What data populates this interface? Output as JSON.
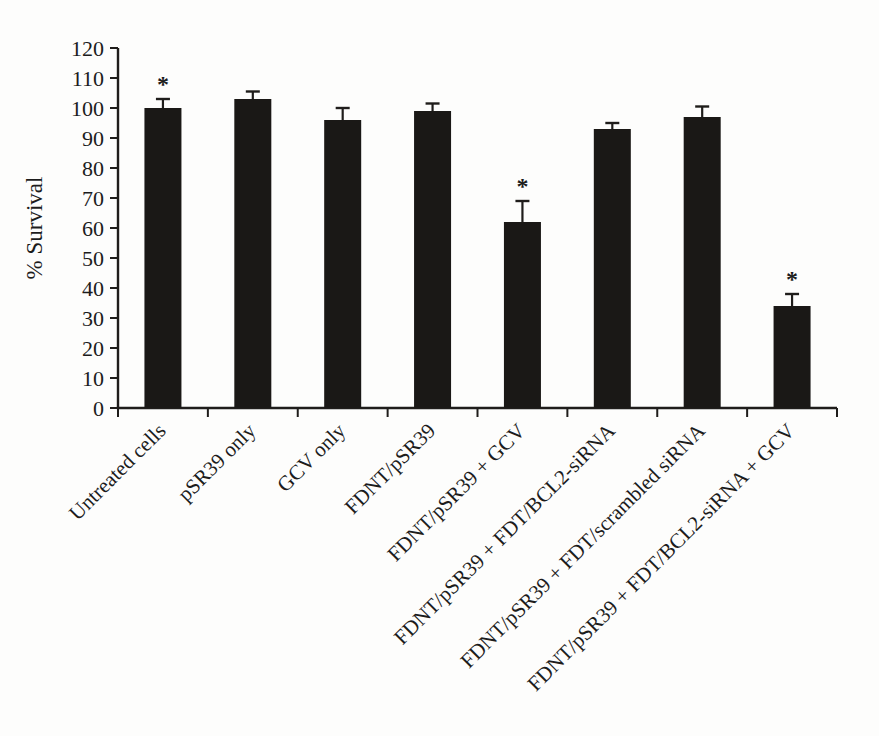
{
  "figure": {
    "background_color": "#fdfdfc"
  },
  "chart_data": {
    "type": "bar",
    "title": "",
    "xlabel": "",
    "ylabel": "% Survival",
    "ylim": [
      0,
      120
    ],
    "ytick_step": 10,
    "grid": false,
    "legend_position": "none",
    "bar_color": "#1a1816",
    "axis_color": "#1f1d1b",
    "significance_marker": "*",
    "categories": [
      "Untreated cells",
      "pSR39 only",
      "GCV only",
      "FDNT/pSR39",
      "FDNT/pSR39 + GCV",
      "FDNT/pSR39 + FDT/BCL2-siRNA",
      "FDNT/pSR39 + FDT/scrambled siRNA",
      "FDNT/pSR39 + FDT/BCL2-siRNA + GCV"
    ],
    "values": [
      100,
      103,
      96,
      99,
      62,
      93,
      97,
      34
    ],
    "errors": [
      3,
      2.5,
      4,
      2.5,
      7,
      2,
      3.5,
      4
    ],
    "significant": [
      true,
      false,
      false,
      false,
      true,
      false,
      false,
      true
    ]
  }
}
